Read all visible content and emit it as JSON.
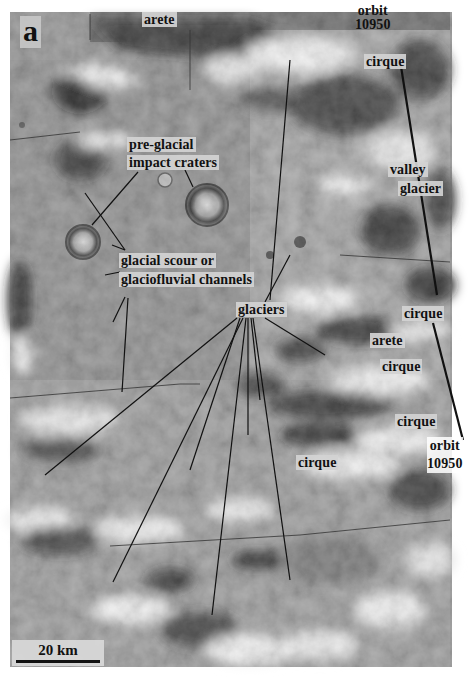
{
  "figure": {
    "panel_letter": "a",
    "scale_bar": {
      "label": "20 km"
    },
    "labels": {
      "arete_top": "arete",
      "orbit_top_line1": "orbit",
      "orbit_top_line2": "10950",
      "cirque_top": "cirque",
      "pre_glacial_line1": "pre-glacial",
      "pre_glacial_line2": "impact craters",
      "valley_glacier_line1": "valley",
      "valley_glacier_line2": "glacier",
      "glacial_scour_line1": "glacial scour or",
      "glacial_scour_line2": "glaciofluvial channels",
      "glaciers": "glaciers",
      "cirque_right_1": "cirque",
      "arete_mid": "arete",
      "cirque_right_2": "cirque",
      "cirque_right_3": "cirque",
      "orbit_bottom_line1": "orbit",
      "orbit_bottom_line2": "10950",
      "cirque_bottom": "cirque"
    },
    "colors": {
      "label_bg": "#d2d2d2",
      "label_text": "#111111",
      "leader_line": "#111111"
    }
  }
}
